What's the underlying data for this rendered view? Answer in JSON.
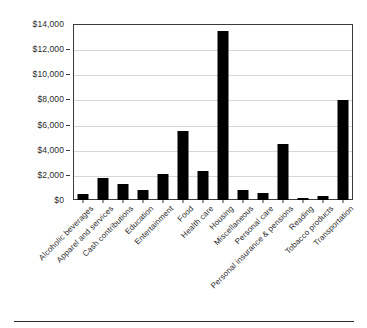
{
  "chart_data": {
    "type": "bar",
    "title": "",
    "xlabel": "",
    "ylabel": "",
    "ylim": [
      0,
      14000
    ],
    "grid": true,
    "legend": null,
    "bar_color": "#000000",
    "categories": [
      "Alcoholic beverages",
      "Apparel and services",
      "Cash contributions",
      "Education",
      "Entertainment",
      "Food",
      "Health care",
      "Housing",
      "Miscellaneous",
      "Personal care",
      "Personal insurance & pensions",
      "Reading",
      "Tobacco products",
      "Transportation"
    ],
    "values": [
      460,
      1750,
      1280,
      770,
      2080,
      5500,
      2340,
      13450,
      800,
      580,
      4480,
      130,
      320,
      7930
    ],
    "y_ticks": [
      0,
      2000,
      4000,
      6000,
      8000,
      10000,
      12000,
      14000
    ],
    "y_tick_labels": [
      "$0",
      "$2,000",
      "$4,000",
      "$6,000",
      "$8,000",
      "$10,000",
      "$12,000",
      "$14,000"
    ]
  }
}
